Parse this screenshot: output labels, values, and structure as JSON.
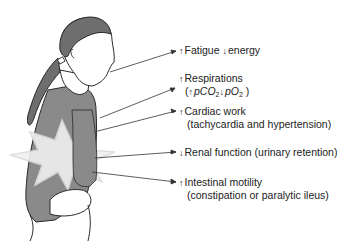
{
  "figure": {
    "effects": [
      {
        "direction": "up",
        "line1": "Fatigue",
        "down_word": "energy"
      },
      {
        "direction": "up",
        "line1": "Respirations",
        "line2_prefix": "(",
        "pco2": "pCO",
        "sub2": "2",
        "po2": "pO",
        "sub2b": "2",
        "line2_suffix": " )"
      },
      {
        "direction": "up",
        "line1": "Cardiac work",
        "line2": "(tachycardia and hypertension)"
      },
      {
        "direction": "down",
        "line1": "Renal function (urinary retention)"
      },
      {
        "direction": "up",
        "line1": "Intestinal motility",
        "line2": "(constipation or paralytic ileus)"
      }
    ],
    "colors": {
      "shirt": "#8a8a8a",
      "hair": "#6e6e6e",
      "outline": "#2a2a2a",
      "burst": "#f2f2f2",
      "line": "#333333"
    },
    "arrows": {
      "up": "↑",
      "down": "↓"
    }
  }
}
